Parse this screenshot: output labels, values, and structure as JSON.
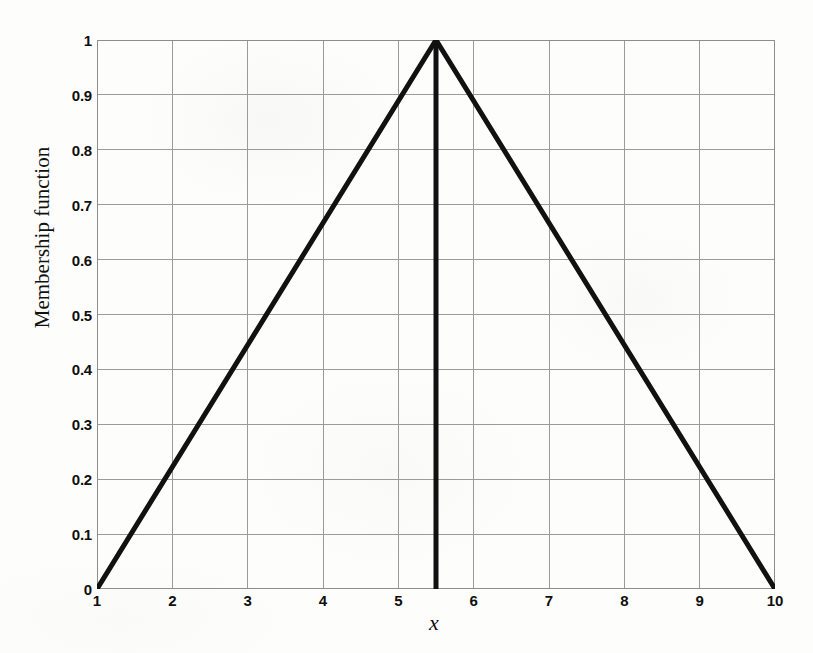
{
  "chart_data": {
    "type": "line",
    "title": "",
    "subtitle": "",
    "xlabel": "x",
    "ylabel": "Membership function",
    "xlim": [
      1,
      10
    ],
    "ylim": [
      0,
      1
    ],
    "grid": true,
    "legend": false,
    "legend_position": "none",
    "xticks": [
      1,
      2,
      3,
      4,
      5,
      6,
      7,
      8,
      9,
      10
    ],
    "xtick_labels": [
      "1",
      "2",
      "3",
      "4",
      "5",
      "6",
      "7",
      "8",
      "9",
      "10"
    ],
    "yticks": [
      0,
      0.1,
      0.2,
      0.3,
      0.4,
      0.5,
      0.6,
      0.7,
      0.8,
      0.9,
      1
    ],
    "ytick_labels": [
      "0",
      "0.1",
      "0.2",
      "0.3",
      "0.4",
      "0.5",
      "0.6",
      "0.7",
      "0.8",
      "0.9",
      "1"
    ],
    "series": [
      {
        "name": "triangular-membership-function",
        "x": [
          1,
          5.5,
          10
        ],
        "values": [
          0,
          1,
          0
        ],
        "color": "#111111",
        "linewidth": 5
      },
      {
        "name": "peak-vertical-line",
        "x": [
          5.5,
          5.5
        ],
        "values": [
          0,
          1
        ],
        "color": "#111111",
        "linewidth": 5
      }
    ],
    "annotations": [
      {
        "name": "peak",
        "x": 5.5,
        "y": 1
      },
      {
        "name": "left-support",
        "x": 1,
        "y": 0
      },
      {
        "name": "right-support",
        "x": 10,
        "y": 0
      }
    ]
  },
  "colors": {
    "curve": "#111111",
    "grid": "#9a9a9a",
    "axis": "#8d8d8d",
    "text": "#100f0d",
    "background": "#fdfdfc"
  }
}
